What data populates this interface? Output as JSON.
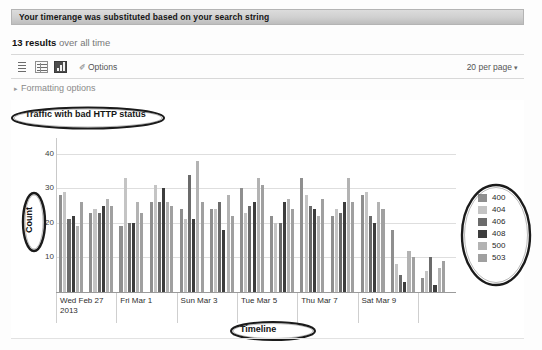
{
  "banner": {
    "message": "Your timerange was substituted based on your search string"
  },
  "results": {
    "count_label": "13 results",
    "scope_label": "over all time"
  },
  "toolbar": {
    "view_list_icon": "list-view-icon",
    "view_table_icon": "table-view-icon",
    "view_chart_icon": "chart-view-icon",
    "options_glyph": "✐",
    "options_label": "Options",
    "per_page_label": "20 per page",
    "per_page_caret": "▾"
  },
  "formatting": {
    "caret": "▸",
    "label": "Formatting options"
  },
  "annotations": {
    "title_circle": "ellipse-around-chart-title",
    "count_circle": "ellipse-around-count-axis-label",
    "timeline_circle": "ellipse-around-timeline-label",
    "legend_circle": "ellipse-around-legend"
  },
  "chart_data": {
    "type": "bar",
    "title": "Traffic with bad HTTP status",
    "xlabel": "Timeline",
    "ylabel": "Count",
    "ylim": [
      0,
      44
    ],
    "yticks": [
      10,
      20,
      30,
      40
    ],
    "grid": true,
    "legend_position": "right",
    "categories": [
      "Wed Feb 27\n2013",
      "Thu Feb 28",
      "Fri Mar 1",
      "Sat Mar 2",
      "Sun Mar 3",
      "Mon Mar 4",
      "Tue Mar 5",
      "Wed Mar 6",
      "Thu Mar 7",
      "Fri Mar 8",
      "Sat Mar 9",
      "Sun Mar 10",
      "Mon Mar 11"
    ],
    "tick_labels": [
      "Wed Feb 27\n2013",
      "Fri Mar 1",
      "Sun Mar 3",
      "Tue Mar 5",
      "Thu Mar 7",
      "Sat Mar 9"
    ],
    "series": [
      {
        "name": "400",
        "color": "#8f8f8f",
        "values": [
          28,
          23,
          19,
          26,
          24,
          24,
          30,
          22,
          33,
          22,
          28,
          18,
          4
        ]
      },
      {
        "name": "404",
        "color": "#c4c4c4",
        "values": [
          29,
          24,
          33,
          31,
          21,
          24,
          23,
          20,
          28,
          24,
          29,
          8,
          6
        ]
      },
      {
        "name": "406",
        "color": "#6b6b6b",
        "values": [
          21,
          23,
          20,
          26,
          34,
          26,
          25,
          20,
          25,
          23,
          22,
          5,
          10
        ]
      },
      {
        "name": "408",
        "color": "#3d3d3d",
        "values": [
          22,
          25,
          20,
          30,
          21,
          18,
          26,
          26,
          24,
          26,
          20,
          3,
          2
        ]
      },
      {
        "name": "500",
        "color": "#b3b3b3",
        "values": [
          19,
          27,
          26,
          26,
          38,
          28,
          33,
          27,
          22,
          33,
          26,
          12,
          7
        ]
      },
      {
        "name": "503",
        "color": "#a0a0a0",
        "values": [
          26,
          25,
          23,
          25,
          26,
          22,
          31,
          24,
          27,
          26,
          24,
          10,
          9
        ]
      }
    ],
    "legend": [
      "400",
      "404",
      "406",
      "408",
      "500",
      "503"
    ],
    "colors": {
      "400": "#8f8f8f",
      "404": "#c4c4c4",
      "406": "#6b6b6b",
      "408": "#3d3d3d",
      "500": "#b3b3b3",
      "503": "#a0a0a0"
    }
  }
}
